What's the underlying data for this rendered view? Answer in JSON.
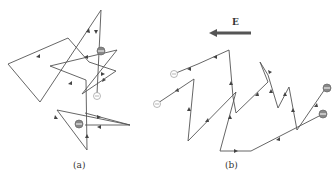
{
  "figure": {
    "panel_a": {
      "caption": "(a)"
    },
    "panel_b": {
      "caption": "(b)",
      "field_label": "E"
    }
  },
  "colors": {
    "path": "#555555",
    "field_arrow": "#555555",
    "charged_particle": "#888888",
    "neutral_particle_stroke": "#999999"
  },
  "icons": {
    "particle_charged": "filled circle with minus sign",
    "particle_neutral": "hollow circle with minus sign"
  }
}
